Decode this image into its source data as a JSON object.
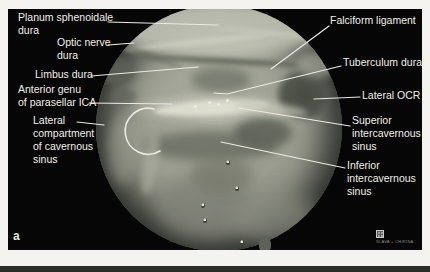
{
  "page": {
    "background": "#f5f3ef",
    "panel_bg": "#060606",
    "label_color": "#f1efe9",
    "leader_color": "#eceae4",
    "tissue_base": "#9b9d91"
  },
  "figure": {
    "panel_label": "a",
    "labels": [
      {
        "id": "planum-sphenoidale-dura",
        "text": "Planum sphenoidale\ndura"
      },
      {
        "id": "optic-nerve-dura",
        "text": "Optic nerve\ndura"
      },
      {
        "id": "limbus-dura",
        "text": "Limbus dura"
      },
      {
        "id": "anterior-genu-of-parasellar-ica",
        "text": "Anterior genu\nof parasellar ICA"
      },
      {
        "id": "lateral-compartment-of-cavernous-sinus",
        "text": "Lateral\ncompartment\nof cavernous\nsinus"
      },
      {
        "id": "falciform-ligament",
        "text": "Falciform ligament"
      },
      {
        "id": "tuberculum-dura",
        "text": "Tuberculum dura"
      },
      {
        "id": "lateral-ocr",
        "text": "Lateral OCR"
      },
      {
        "id": "superior-intercavernous-sinus",
        "text": "Superior\nintercavernous\nsinus"
      },
      {
        "id": "inferior-intercavernous-sinus",
        "text": "Inferior\nintercavernous\nsinus"
      }
    ],
    "watermark": {
      "text": "SLAVA + CHIRINA"
    }
  }
}
